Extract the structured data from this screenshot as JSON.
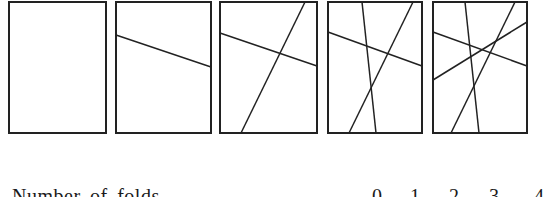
{
  "figure": {
    "stroke_color": "#222222",
    "panels": [
      {
        "folds": 0,
        "rect": {
          "x": 9,
          "y": 2,
          "w": 97,
          "h": 131
        },
        "lines": []
      },
      {
        "folds": 1,
        "rect": {
          "x": 116,
          "y": 2,
          "w": 95,
          "h": 131
        },
        "lines": [
          {
            "x1": 116,
            "y1": 35,
            "x2": 211,
            "y2": 67
          }
        ]
      },
      {
        "folds": 2,
        "rect": {
          "x": 220,
          "y": 2,
          "w": 97,
          "h": 131
        },
        "lines": [
          {
            "x1": 220,
            "y1": 33,
            "x2": 317,
            "y2": 66
          },
          {
            "x1": 305,
            "y1": 2,
            "x2": 241,
            "y2": 133
          }
        ]
      },
      {
        "folds": 3,
        "rect": {
          "x": 328,
          "y": 2,
          "w": 94,
          "h": 131
        },
        "lines": [
          {
            "x1": 328,
            "y1": 32,
            "x2": 422,
            "y2": 66
          },
          {
            "x1": 413,
            "y1": 2,
            "x2": 349,
            "y2": 133
          },
          {
            "x1": 362,
            "y1": 2,
            "x2": 376,
            "y2": 133
          }
        ]
      },
      {
        "folds": 4,
        "rect": {
          "x": 433,
          "y": 2,
          "w": 94,
          "h": 131
        },
        "lines": [
          {
            "x1": 433,
            "y1": 32,
            "x2": 527,
            "y2": 66
          },
          {
            "x1": 515,
            "y1": 2,
            "x2": 451,
            "y2": 133
          },
          {
            "x1": 465,
            "y1": 2,
            "x2": 479,
            "y2": 133
          },
          {
            "x1": 433,
            "y1": 80,
            "x2": 527,
            "y2": 22
          }
        ]
      }
    ]
  },
  "caption": {
    "text": "Number of folds",
    "values": [
      "0",
      "1",
      "2",
      "3",
      "4"
    ],
    "value_x": [
      372,
      410,
      449,
      489,
      534
    ]
  }
}
